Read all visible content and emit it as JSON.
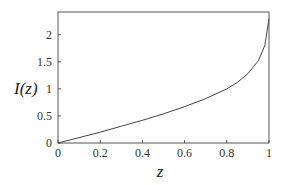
{
  "chart_data": {
    "type": "line",
    "title": "",
    "xlabel": "z",
    "ylabel": "I(z)",
    "xlim": [
      0,
      1
    ],
    "ylim": [
      0,
      2.42
    ],
    "xticks": [
      "0",
      "0.2",
      "0.4",
      "0.6",
      "0.8",
      "1"
    ],
    "yticks": [
      "0",
      "0.5",
      "1",
      "1.5",
      "2"
    ],
    "grid": false,
    "legend": null,
    "series": [
      {
        "name": "I(z)",
        "x": [
          0,
          0.1,
          0.2,
          0.3,
          0.4,
          0.5,
          0.6,
          0.7,
          0.8,
          0.85,
          0.9,
          0.95,
          0.98,
          1.0
        ],
        "y": [
          0,
          0.1,
          0.2,
          0.31,
          0.42,
          0.54,
          0.67,
          0.82,
          1.0,
          1.12,
          1.28,
          1.52,
          1.8,
          2.3
        ]
      }
    ]
  }
}
